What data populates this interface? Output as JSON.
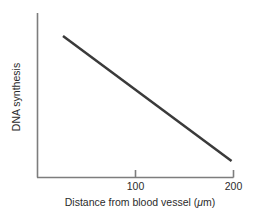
{
  "chart_data": {
    "type": "line",
    "title": "",
    "subtitle": "",
    "xlabel": "Distance from blood vessel (μm)",
    "xlabel_prefix": "Distance from blood vessel (",
    "xlabel_mu": "μ",
    "xlabel_suffix": "m)",
    "ylabel": "DNA synthesis",
    "xlim": [
      0,
      200
    ],
    "ylim": [
      0,
      1
    ],
    "xticks": [
      100,
      200
    ],
    "xtick_labels": [
      "100",
      "200"
    ],
    "yticks": [],
    "ytick_labels": [],
    "grid": false,
    "legend": null,
    "series": [
      {
        "name": "DNA synthesis vs distance",
        "color": "#3a3a3a",
        "linewidth": 2.5,
        "x": [
          26,
          198
        ],
        "y": [
          0.86,
          0.1
        ],
        "points": [
          {
            "x": 26,
            "y": 0.86
          },
          {
            "x": 198,
            "y": 0.1
          }
        ]
      }
    ],
    "annotations": [],
    "axis_color": "#7d7d7d",
    "text_color": "#2b2b2b",
    "background": "#ffffff"
  },
  "figure": {
    "name": "dna-synthesis-vs-distance-plot"
  }
}
